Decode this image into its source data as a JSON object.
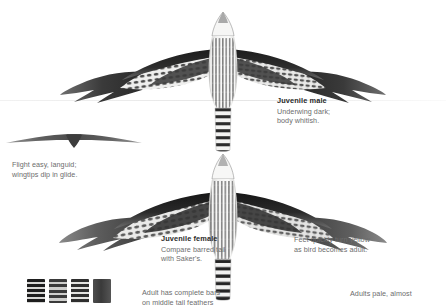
{
  "plate": {
    "subject": "Gyrfalcon juveniles in flight, underwing view",
    "background_color": "#ffffff",
    "heading_color": "#2b2b2b",
    "body_text_color": "#6d6d6d"
  },
  "captions": {
    "juvenile_male": {
      "heading": "Juvenile male",
      "lines": [
        "Underwing dark;",
        "body whitish."
      ]
    },
    "glide": {
      "lines": [
        "Flight easy, languid;",
        "wingtips dip in glide."
      ]
    },
    "juvenile_female": {
      "heading": "Juvenile female",
      "lines": [
        "Compare barred tail",
        "with Saker's."
      ]
    },
    "feet": {
      "lines": [
        "Feet quickly turn yellow",
        "as bird becomes adult."
      ]
    },
    "tail_feathers": {
      "lines": [
        "Adult has complete bars",
        "on middle tail feathers"
      ]
    },
    "adults": {
      "lines": [
        "Adults pale, almost"
      ]
    }
  },
  "figures": {
    "juvenile_male_bird": "falcon-underwing-spread",
    "glide_silhouette": "falcon-glide-silhouette",
    "juvenile_female_bird": "falcon-underwing-spread",
    "tail_feather_swatches": [
      {
        "name": "tail-feather-1",
        "pattern": "barred"
      },
      {
        "name": "tail-feather-2",
        "pattern": "barred"
      },
      {
        "name": "tail-feather-3",
        "pattern": "barred-partial"
      },
      {
        "name": "tail-feather-4",
        "pattern": "solid-dark"
      }
    ]
  }
}
